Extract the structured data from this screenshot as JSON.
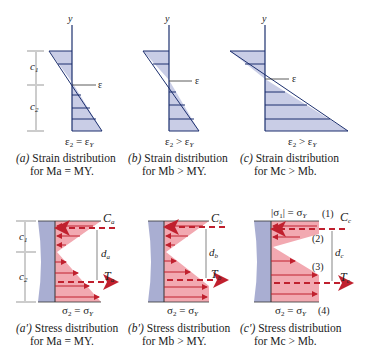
{
  "colors": {
    "strain_fill": "#c9cde6",
    "strain_line": "#1c2f6e",
    "stress_fill": "#f2a9b1",
    "stress_arrow": "#c0202e",
    "section_fill": "#a9aed2",
    "text": "#222222"
  },
  "strain": [
    {
      "id": "a",
      "eq": "ε₂ = εY",
      "label_y": "y",
      "label_eps": "ε",
      "label_c1": "c₁",
      "label_c2": "c₂",
      "caption_tag": "(a)",
      "caption_line1": "Strain distribution",
      "caption_line2": "for Ma = MY."
    },
    {
      "id": "b",
      "eq": "ε₂ > εY",
      "label_y": "y",
      "label_eps": "ε",
      "caption_tag": "(b)",
      "caption_line1": "Strain distribution",
      "caption_line2": "for Mb > MY."
    },
    {
      "id": "c",
      "eq": "ε₂ > εY",
      "label_y": "y",
      "label_eps": "ε",
      "caption_tag": "(c)",
      "caption_line1": "Strain distribution",
      "caption_line2": "for Mc > Mb."
    }
  ],
  "stress": [
    {
      "id": "a'",
      "eq": "σ₂ = σY",
      "C": "Ca",
      "T": "Ta",
      "d": "da",
      "label_c1": "c₁",
      "label_c2": "c₂",
      "caption_tag": "(a′)",
      "caption_line1": "Stress distribution",
      "caption_line2": "for Ma = MY."
    },
    {
      "id": "b'",
      "eq": "σ₂ = σY",
      "C": "Cb",
      "T": "Tb",
      "d": "db",
      "caption_tag": "(b′)",
      "caption_line1": "Stress distribution",
      "caption_line2": "for Mb > MY."
    },
    {
      "id": "c'",
      "eq": "σ₂ = σY",
      "eq_top": "|σ₁| = σY",
      "C": "Cc",
      "T": "Tc",
      "d": "dc",
      "markers": [
        "(1)",
        "(2)",
        "(3)",
        "(4)"
      ],
      "caption_tag": "(c′)",
      "caption_line1": "Stress distribution",
      "caption_line2": "for Mc > Mb."
    }
  ]
}
